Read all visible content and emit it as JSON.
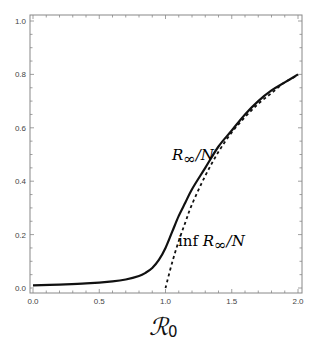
{
  "chart_data": {
    "type": "line",
    "title": "",
    "xlabel": "ℛ0",
    "ylabel": "",
    "xlim": [
      0.0,
      2.0
    ],
    "ylim": [
      0.0,
      1.0
    ],
    "grid": false,
    "legend": "none (inline curve labels)",
    "x_ticks": [
      "0.0",
      "0.5",
      "1.0",
      "1.5",
      "2.0"
    ],
    "y_ticks": [
      "0.0",
      "0.2",
      "0.4",
      "0.6",
      "0.8",
      "1.0"
    ],
    "series": [
      {
        "name": "R∞/N",
        "style": "solid",
        "x": [
          0.0,
          0.2,
          0.4,
          0.6,
          0.7,
          0.8,
          0.85,
          0.9,
          0.95,
          1.0,
          1.05,
          1.1,
          1.15,
          1.2,
          1.3,
          1.4,
          1.5,
          1.6,
          1.7,
          1.8,
          1.9,
          2.0
        ],
        "values": [
          0.01,
          0.013,
          0.017,
          0.025,
          0.032,
          0.045,
          0.057,
          0.075,
          0.105,
          0.15,
          0.21,
          0.27,
          0.32,
          0.37,
          0.45,
          0.53,
          0.59,
          0.65,
          0.7,
          0.74,
          0.77,
          0.8
        ]
      },
      {
        "name": "inf R∞/N",
        "style": "dashed",
        "x": [
          1.0,
          1.05,
          1.1,
          1.15,
          1.2,
          1.3,
          1.4,
          1.5,
          1.6,
          1.7,
          1.8,
          1.9,
          2.0
        ],
        "values": [
          0.0,
          0.095,
          0.176,
          0.246,
          0.313,
          0.42,
          0.51,
          0.583,
          0.64,
          0.69,
          0.73,
          0.77,
          0.797
        ]
      }
    ],
    "annotations": [
      {
        "text": "R∞/N",
        "x": 1.05,
        "y": 0.55
      },
      {
        "text": "inf R∞/N",
        "x": 1.3,
        "y": 0.1
      }
    ]
  },
  "labels": {
    "x_axis": {
      "main": "ℛ",
      "sub": "0"
    },
    "curve_solid": {
      "main": "R",
      "sub": "∞",
      "tail": "/N"
    },
    "curve_dashed": {
      "prefix": "inf ",
      "main": "R",
      "sub": "∞",
      "tail": "/N"
    }
  }
}
